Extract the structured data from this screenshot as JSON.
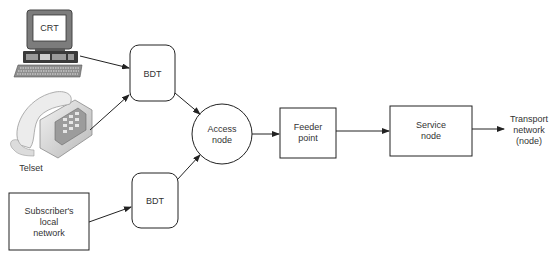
{
  "diagram": {
    "nodes": {
      "crt": {
        "label": "CRT",
        "kind": "computer-terminal"
      },
      "telset": {
        "label": "Telset",
        "kind": "telephone"
      },
      "subscriber": {
        "label_lines": [
          "Subscriber's",
          "local",
          "network"
        ]
      },
      "bdt_top": {
        "label": "BDT"
      },
      "bdt_bottom": {
        "label": "BDT"
      },
      "access": {
        "label_lines": [
          "Access",
          "node"
        ]
      },
      "feeder": {
        "label_lines": [
          "Feeder",
          "point"
        ]
      },
      "service": {
        "label_lines": [
          "Service",
          "node"
        ]
      },
      "transport": {
        "label_lines": [
          "Transport",
          "network",
          "(node)"
        ]
      }
    },
    "edges": [
      {
        "from": "crt",
        "to": "bdt_top"
      },
      {
        "from": "telset",
        "to": "bdt_top"
      },
      {
        "from": "subscriber",
        "to": "bdt_bottom"
      },
      {
        "from": "bdt_top",
        "to": "access"
      },
      {
        "from": "bdt_bottom",
        "to": "access"
      },
      {
        "from": "access",
        "to": "feeder"
      },
      {
        "from": "feeder",
        "to": "service"
      },
      {
        "from": "service",
        "to": "transport"
      }
    ]
  }
}
